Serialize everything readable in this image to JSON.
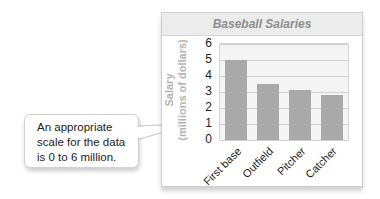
{
  "chart_data": {
    "type": "bar",
    "title": "Baseball Salaries",
    "categories": [
      "First base",
      "Outfield",
      "Pitcher",
      "Catcher"
    ],
    "values": [
      5.0,
      3.5,
      3.1,
      2.8
    ],
    "xlabel": "",
    "ylabel": "Salary (millions of dollars)",
    "ylabel_lines": [
      "Salary",
      "(millions of dollars)"
    ],
    "ylim": [
      0,
      6
    ],
    "yticks": [
      "0",
      "1",
      "2",
      "3",
      "4",
      "5",
      "6"
    ],
    "grid": true,
    "legend": "none",
    "bar_color": "#a9a9a9",
    "annotation": "An appropriate scale for the data is 0 to 6 million."
  },
  "callout": {
    "lines": [
      "An appropriate",
      "scale for the data",
      "is 0 to 6 million."
    ]
  }
}
